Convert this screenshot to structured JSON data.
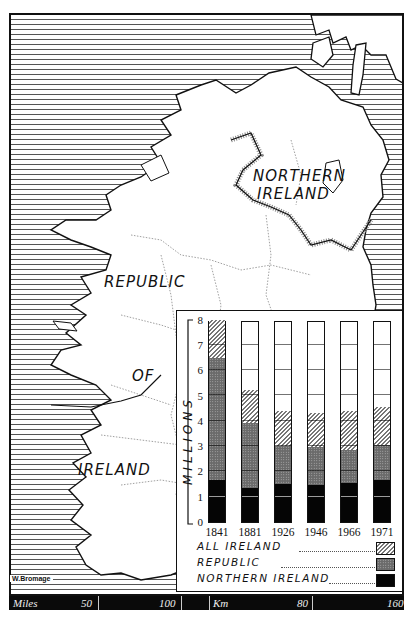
{
  "map": {
    "labels": {
      "northern_ireland": [
        "NORTHERN",
        "IRELAND"
      ],
      "republic": [
        "REPUBLIC",
        "OF",
        "IRELAND"
      ]
    },
    "signature": "W.Bromage",
    "scalebar": {
      "miles_label": "Miles",
      "miles_ticks": [
        "50",
        "100"
      ],
      "km_label": "Km",
      "km_ticks": [
        "80",
        "160"
      ]
    }
  },
  "chart_data": {
    "type": "bar",
    "stacked": true,
    "title": "",
    "xlabel": "",
    "ylabel": "MILLIONS",
    "ylim": [
      0,
      8
    ],
    "yticks": [
      "0",
      "1",
      "2",
      "3",
      "4",
      "5",
      "6",
      "7",
      "8"
    ],
    "categories": [
      "1841",
      "1881",
      "1926",
      "1946",
      "1966",
      "1971"
    ],
    "series": [
      {
        "name": "NORTHERN IRELAND",
        "pattern": "solid-black",
        "values": [
          1.65,
          1.35,
          1.5,
          1.45,
          1.55,
          1.65
        ]
      },
      {
        "name": "REPUBLIC",
        "pattern": "dotted-grey",
        "values": [
          4.85,
          2.55,
          1.5,
          1.5,
          1.3,
          1.4
        ]
      },
      {
        "name": "ALL IRELAND",
        "pattern": "diagonal-hatch",
        "values": [
          1.7,
          1.3,
          1.4,
          1.35,
          1.55,
          1.5
        ]
      }
    ],
    "cumulative_tops": {
      "northern_ireland": [
        1.65,
        1.35,
        1.5,
        1.45,
        1.55,
        1.65
      ],
      "republic": [
        6.5,
        3.9,
        3.0,
        2.95,
        2.85,
        3.05
      ],
      "all_ireland": [
        8.2,
        5.2,
        4.4,
        4.3,
        4.4,
        4.55
      ]
    },
    "legend": {
      "position": "bottom",
      "entries": [
        "ALL IRELAND",
        "REPUBLIC",
        "NORTHERN IRELAND"
      ]
    },
    "grid": "horizontal lines inside bars at each million"
  },
  "colors": {
    "ink": "#111111",
    "ni": "#050505",
    "republic": "#6a6a6a",
    "hatch": "#777777",
    "paper": "#ffffff"
  }
}
